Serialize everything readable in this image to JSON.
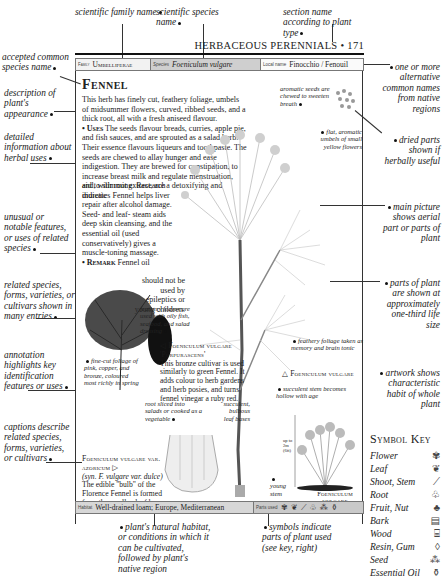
{
  "top_annotations": {
    "family": "scientific family name",
    "species": "scientific species name",
    "section": "section name according to plant type"
  },
  "running_head": "HERBACEOUS PERENNIALS • 171",
  "info_bar": {
    "family_label": "Family",
    "family_value": "Umbelliferae",
    "species_label": "Species",
    "species_value": "Foeniculum vulgare",
    "local_label": "Local name",
    "local_value": "Finocchio / Fenouil"
  },
  "entry": {
    "title": "Fennel",
    "description": "This herb has finely cut, feathery foliage, umbels of midsummer flowers, curved, ribbed seeds, and a thick root, all with a fresh aniseed flavour.",
    "uses_label": "• Uses",
    "uses_text_1": " The seeds flavour breads, curries, apple pie, and fish sauces, and are sprouted as a salad herb. Their essence flavours liqueurs and toothpaste. The seeds are chewed to allay hunger and ease indigestion. They are brewed for constipation, to increase breast milk and regulate menstruation, and, with root extract, are a detoxifying and diuretic",
    "uses_text_2": "aid to slimming. Research indicates Fennel helps liver repair after alcohol damage. Seed- and leaf- steam aids deep skin cleansing, and the essential oil (used conservatively) gives a muscle-toning massage.",
    "remark_label": "• Remark",
    "remark_text_1": " Fennel oil",
    "remark_text_2": "should not be used by epileptics or young children."
  },
  "left_annotations": [
    "accepted common species name",
    "description of plant's appearance",
    "detailed information about herbal uses",
    "unusual or notable features, or uses of related species",
    "related species, forms, varieties, or cultivars shown in many entries",
    "annotation highlights key identification features or uses",
    "captions describe related species, forms, varieties, or cultivars"
  ],
  "right_annotations": [
    "one or more alternative common names from native regions",
    "dried parts shown if herbally useful",
    "main picture shows aerial part or parts of plant",
    "parts of plant are shown at approximately one-third life size",
    "artwork shows characteristic habit of whole plant"
  ],
  "plant_annotations": {
    "seeds": "aromatic seeds are chewed to sweeten breath",
    "umbels": "flat, aromatic umbels of small yellow flowers",
    "feathery_leaves": "feathery leaves are used with oily fish, seafood, and salad dressing",
    "foliage_tonic": "feathery foliage taken as memory and brain tonic",
    "stem": "succulent stem becomes hollow with age",
    "young_stem": "young stem",
    "fine_cut": "fine-cut foliage of pink, copper, and bronze, coloured most richly in spring",
    "root": "root sliced into salads or cooked as a vegetable",
    "bases": "succulent, bulbous leaf bases",
    "scale": "up to 2m (6ft)"
  },
  "captions": {
    "purpurascens_title": "◁ Foeniculum vulgare 'Purpurascens'",
    "purpurascens_text": "This bronze cultivar is used similarly to green Fennel. It adds colour to herb gardens and herb posies, and turns fennel vinegar a ruby red.",
    "vulgare_title": "△ Foeniculum vulgare",
    "azoricum_title": "Foeniculum vulgare var. azoricum ▷",
    "azoricum_syn": "(syn. F. vulgare var. dulce)",
    "azoricum_text": "The edible \"bulb\" of the Florence Fennel is formed from the swollen leaf bases.",
    "habit_label": "Foeniculum vulgare"
  },
  "footer_bar": {
    "habitat_label": "Habitat",
    "habitat_value": "Well-drained loam; Europe, Mediterranean",
    "parts_label": "Parts used",
    "parts_icons": [
      "flower-icon",
      "leaf-icon",
      "shoot-icon",
      "root-icon",
      "seed-icon",
      "essential-oil-icon"
    ]
  },
  "bottom_annotations": {
    "habitat": "plant's natural habitat, or conditions in which it can be cultivated, followed by plant's native region",
    "symbols": "symbols indicate parts of plant used (see key, right)"
  },
  "symbol_key": {
    "title": "Symbol Key",
    "items": [
      {
        "label": "Flower",
        "glyph": "✾"
      },
      {
        "label": "Leaf",
        "glyph": "❦"
      },
      {
        "label": "Shoot, Stem",
        "glyph": "⟋"
      },
      {
        "label": "Root",
        "glyph": "♧"
      },
      {
        "label": "Fruit, Nut",
        "glyph": "♣"
      },
      {
        "label": "Bark",
        "glyph": "▤"
      },
      {
        "label": "Wood",
        "glyph": "⌸"
      },
      {
        "label": "Resin, Gum",
        "glyph": "◊"
      },
      {
        "label": "Seed",
        "glyph": "⁂"
      },
      {
        "label": "Essential Oil",
        "glyph": "⚱"
      }
    ]
  }
}
